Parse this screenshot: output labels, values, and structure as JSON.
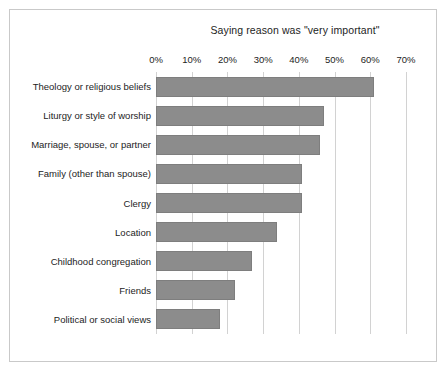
{
  "chart_data": {
    "type": "bar",
    "orientation": "horizontal",
    "title": "Saying reason was \"very important\"",
    "xlabel": "",
    "ylabel": "",
    "categories": [
      "Theology or religious beliefs",
      "Liturgy or style of worship",
      "Marriage, spouse, or partner",
      "Family (other than spouse)",
      "Clergy",
      "Location",
      "Childhood congregation",
      "Friends",
      "Political or social views"
    ],
    "values": [
      61,
      47,
      46,
      41,
      41,
      34,
      27,
      22,
      18
    ],
    "value_unit": "%",
    "xlim": [
      0,
      70
    ],
    "xticks": [
      0,
      10,
      20,
      30,
      40,
      50,
      60,
      70
    ],
    "xtick_labels": [
      "0%",
      "10%",
      "20%",
      "30%",
      "40%",
      "50%",
      "60%",
      "70%"
    ],
    "grid": "vertical",
    "legend": "none",
    "bar_color": "#8c8c8c",
    "bar_border_color": "#7e7e7e",
    "gridline_color": "#d2d2d2",
    "frame_color": "#c9c9c9",
    "background": "#ffffff",
    "text_color": "#1d1d1d"
  }
}
